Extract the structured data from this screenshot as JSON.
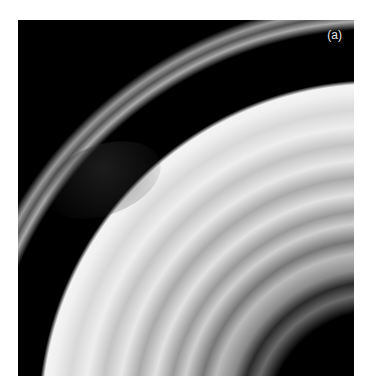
{
  "figure": {
    "panel_label": "(a)"
  },
  "colors": {
    "background": "#ffffff",
    "space": "#000000",
    "ring_light": "#e6e6e6",
    "ring_mid": "#9a9a9a",
    "ring_dark": "#4a4a4a"
  }
}
